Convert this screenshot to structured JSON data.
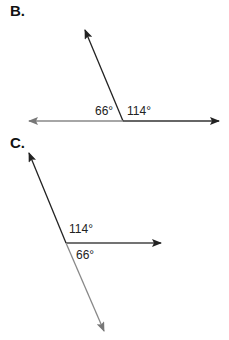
{
  "figures": [
    {
      "label": "B.",
      "angles": [
        {
          "value": "66°",
          "position": "left-of-vertex"
        },
        {
          "value": "114°",
          "position": "right-of-vertex"
        }
      ],
      "vertex": [
        123,
        121
      ],
      "rays": [
        {
          "end": [
            85,
            30
          ],
          "color": "#222222"
        },
        {
          "end": [
            29,
            121
          ],
          "color": "#888888"
        },
        {
          "end": [
            219,
            121
          ],
          "color": "#222222"
        }
      ]
    },
    {
      "label": "C.",
      "angles": [
        {
          "value": "114°",
          "position": "above-ray"
        },
        {
          "value": "66°",
          "position": "below-ray"
        }
      ],
      "vertex": [
        66,
        243
      ],
      "rays": [
        {
          "end": [
            29,
            153
          ],
          "color": "#222222"
        },
        {
          "end": [
            161,
            243
          ],
          "color": "#444444"
        },
        {
          "end": [
            104,
            331
          ],
          "color": "#888888"
        }
      ]
    }
  ]
}
